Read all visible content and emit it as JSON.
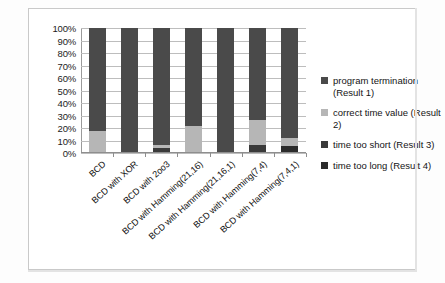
{
  "chart_data": {
    "type": "bar",
    "subtype": "100% stacked column",
    "title": "",
    "xlabel": "",
    "ylabel": "",
    "ylim": [
      0,
      100
    ],
    "yunit": "%",
    "grid": true,
    "legend_position": "right",
    "ytick_labels": [
      "100%",
      "90%",
      "80%",
      "70%",
      "60%",
      "50%",
      "40%",
      "30%",
      "20%",
      "10%",
      "0%"
    ],
    "ytick_values": [
      100,
      90,
      80,
      70,
      60,
      50,
      40,
      30,
      20,
      10,
      0
    ],
    "categories": [
      "BCD",
      "BCD with XOR",
      "BCD with 2oo3",
      "BCD with Hamming(21,16)",
      "BCD with Hamming(21,16,1)",
      "BCD with Hamming(7,4)",
      "BCD with Hamming(7,4,1)"
    ],
    "series": [
      {
        "name": "program termination (Result 1)",
        "color": "#4a4a4a",
        "values": [
          83,
          100,
          94,
          79,
          100,
          74,
          89
        ]
      },
      {
        "name": "correct time value (Result 2)",
        "color": "#b6b6b6",
        "values": [
          17,
          0,
          3,
          21,
          0,
          20,
          6
        ]
      },
      {
        "name": "time too short (Result 3)",
        "color": "#3a3a3a",
        "values": [
          0,
          0,
          3,
          0,
          0,
          6,
          0
        ]
      },
      {
        "name": "time too long (Result 4)",
        "color": "#2b2b2b",
        "values": [
          0,
          0,
          0,
          0,
          0,
          0,
          5
        ]
      }
    ],
    "legend_entries": [
      "program termination (Result 1)",
      "correct time value (Result 2)",
      "time too short (Result 3)",
      "time too long (Result 4)"
    ]
  }
}
